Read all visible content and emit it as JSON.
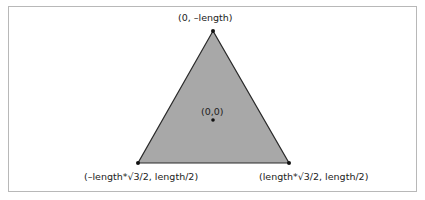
{
  "diagram": {
    "type": "equilateral-triangle-coordinates",
    "colors": {
      "triangle_fill": "#a8a8a8",
      "triangle_stroke": "#2a2a2a",
      "vertex_dot": "#111111",
      "frame_border": "#b8b8b8",
      "background": "#ffffff"
    },
    "vertices": {
      "top": {
        "label": "(0, –length)",
        "px": [
          213,
          31
        ]
      },
      "bottom_left": {
        "label": "(–length*√3/2, length/2)",
        "px": [
          138,
          163
        ]
      },
      "bottom_right": {
        "label": "(length*√3/2, length/2)",
        "px": [
          289,
          163
        ]
      }
    },
    "center": {
      "label": "(0,0)",
      "px": [
        213,
        120
      ]
    }
  }
}
